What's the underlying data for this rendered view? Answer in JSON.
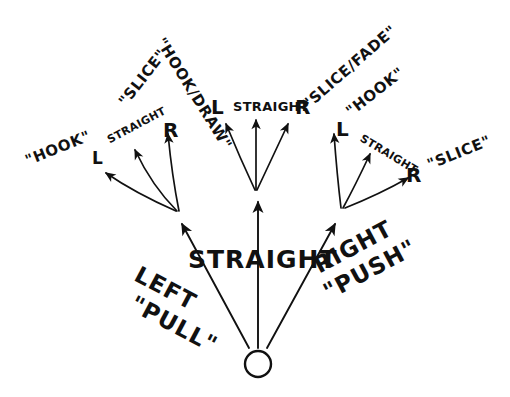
{
  "diagram": {
    "ball": {
      "name": "golf-ball",
      "cx": 258,
      "cy": 364,
      "r": 13
    },
    "stroke_color": "#111111",
    "background_color": "#ffffff",
    "primary_paths": [
      {
        "id": "left",
        "label_line1": "LEFT",
        "label_line2": "\"PULL\""
      },
      {
        "id": "center",
        "label_line1": "STRAIGHT",
        "label_line2": ""
      },
      {
        "id": "right",
        "label_line1": "RIGHT",
        "label_line2": "\"PUSH\""
      }
    ],
    "groups": [
      {
        "id": "left-group",
        "direction_labels": {
          "left": "L",
          "straight": "STRAIGHT",
          "right": "R"
        },
        "outcome_left": "\"HOOK\"",
        "outcome_right": "\"SLICE\""
      },
      {
        "id": "center-group",
        "direction_labels": {
          "left": "L",
          "straight": "STRAIGHT",
          "right": "R"
        },
        "outcome_left": "\"HOOK/DRAW\"",
        "outcome_right": "\"SLICE/FADE\""
      },
      {
        "id": "right-group",
        "direction_labels": {
          "left": "L",
          "straight": "STRAIGHT",
          "right": "R"
        },
        "outcome_left": "\"HOOK\"",
        "outcome_right": "\"SLICE\""
      }
    ]
  }
}
